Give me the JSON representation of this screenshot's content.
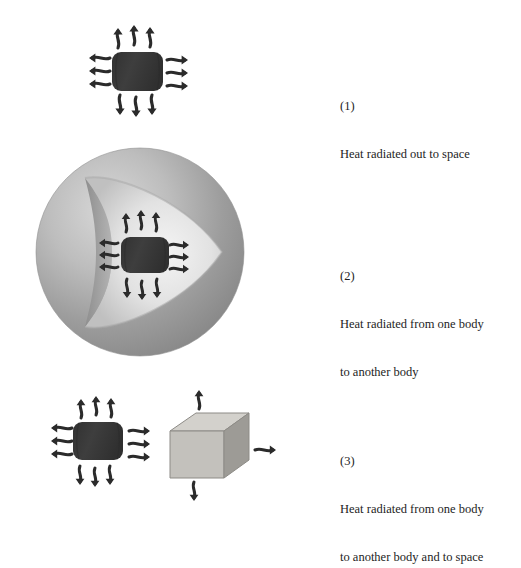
{
  "figure": {
    "background_color": "#ffffff",
    "title": "",
    "panels": [
      {
        "id": "panel-1",
        "index_label": "(1)",
        "caption_lines": [
          "Heat radiated out to space"
        ],
        "description": "Dark body radiating heat outward in all directions to space",
        "bodies": [
          {
            "name": "hot-body",
            "shape": "rounded-box",
            "color": "#3b3b3b",
            "center": [
              137,
              71
            ]
          }
        ],
        "arrow_groups": [
          {
            "name": "arrows-up",
            "direction": "up",
            "count": 3
          },
          {
            "name": "arrows-left",
            "direction": "left",
            "count": 3
          },
          {
            "name": "arrows-right",
            "direction": "right",
            "count": 3
          },
          {
            "name": "arrows-down",
            "direction": "down",
            "count": 3
          }
        ]
      },
      {
        "id": "panel-2",
        "index_label": "(2)",
        "caption_lines": [
          "Heat radiated from one body",
          "to another body"
        ],
        "description": "Cut-away sphere enclosing a dark body that radiates heat to the inner surface",
        "bodies": [
          {
            "name": "enclosing-sphere",
            "shape": "sphere-cutaway",
            "color": "#9a9a9a",
            "highlight_color": "#e2e2e2",
            "center": [
              140,
              252
            ],
            "radius": 105
          },
          {
            "name": "hot-body",
            "shape": "rounded-box",
            "color": "#3b3b3b",
            "center": [
              143,
              255
            ]
          }
        ],
        "arrow_groups": [
          {
            "name": "arrows-up",
            "direction": "up",
            "count": 3
          },
          {
            "name": "arrows-left",
            "direction": "left",
            "count": 3
          },
          {
            "name": "arrows-right",
            "direction": "right",
            "count": 3
          },
          {
            "name": "arrows-down",
            "direction": "down",
            "count": 3
          }
        ]
      },
      {
        "id": "panel-3",
        "index_label": "(3)",
        "caption_lines": [
          "Heat radiated from one body",
          "to another body and to space"
        ],
        "description": "Dark body radiating to a light gray cube and to space; the cube also radiates out",
        "bodies": [
          {
            "name": "hot-body",
            "shape": "rounded-box",
            "color": "#3b3b3b",
            "center": [
              98,
              440
            ]
          },
          {
            "name": "receiving-cube",
            "shape": "cube",
            "top_face_color": "#d3d1cc",
            "front_face_color": "#c3c1bc",
            "side_face_color": "#9d9b96",
            "center": [
              207,
              447
            ]
          }
        ],
        "arrow_groups": [
          {
            "name": "arrows-up",
            "direction": "up",
            "count": 3
          },
          {
            "name": "arrows-left",
            "direction": "left",
            "count": 2
          },
          {
            "name": "arrows-down",
            "direction": "down",
            "count": 3
          },
          {
            "name": "arrows-between-bodies",
            "direction": "right",
            "count": 3
          },
          {
            "name": "cube-arrow-up",
            "direction": "up",
            "count": 1
          },
          {
            "name": "cube-arrow-right",
            "direction": "right",
            "count": 1
          },
          {
            "name": "cube-arrow-down",
            "direction": "down",
            "count": 1
          }
        ]
      }
    ]
  },
  "colors": {
    "arrow": "#2b2b2b",
    "hot_body": "#3b3b3b",
    "sphere_mid": "#9a9a9a",
    "sphere_light": "#e4e4e4",
    "sphere_dark": "#7b7b7b",
    "cube_top": "#d3d1cc",
    "cube_front": "#c3c1bc",
    "cube_side": "#9d9b96",
    "text": "#1d1d1d",
    "background": "#ffffff"
  }
}
